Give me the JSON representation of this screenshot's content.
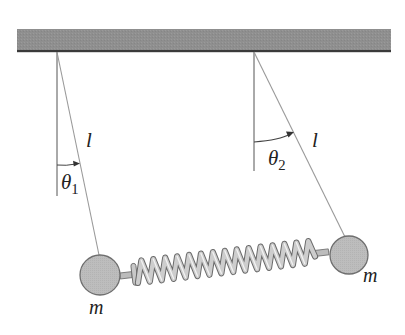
{
  "figure": {
    "colors": {
      "ceiling_fill": "#8f8f8f",
      "ceiling_edge": "#3a3a3a",
      "string": "#9a9a9a",
      "reference_line": "#555555",
      "mass_fill": "#bdbdbd",
      "mass_edge": "#6e6e6e",
      "spring_fill": "#c8c8c8",
      "spring_edge": "#6a6a6a",
      "text": "#222222"
    },
    "labels": {
      "length_left": "l",
      "length_right": "l",
      "theta1_symbol": "θ",
      "theta1_sub": "1",
      "theta2_symbol": "θ",
      "theta2_sub": "2",
      "mass_left": "m",
      "mass_right": "m"
    }
  }
}
